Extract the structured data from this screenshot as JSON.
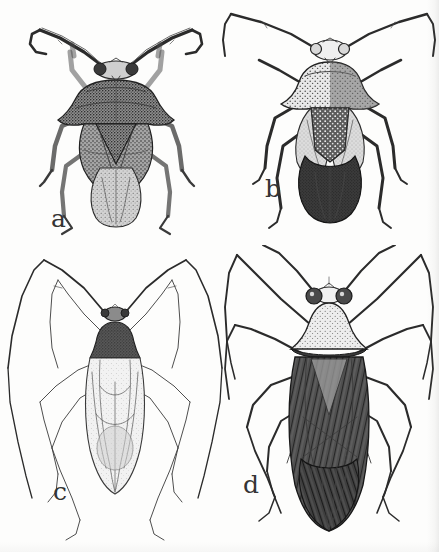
{
  "plate": {
    "type": "scanned-scientific-illustration-plate",
    "medium": "pen-and-ink stipple drawing",
    "background_color": "#fdfdfc",
    "ink_color": "#2b2b2b",
    "layout": "2x2 grid of four dorsal-view insect habitus drawings",
    "width_px": 439,
    "height_px": 552
  },
  "figures": [
    {
      "label": "a",
      "label_position": "lower-left of figure",
      "quadrant": "top-left",
      "subject": "true bug, dorsal view",
      "description": "Broad-bodied bug with mottled granular pronotum bearing lateral humeral angles, thick flattened antennae held in a wide inverted-V, dark speckled hemelytra and a paler rounded abdominal apex",
      "tone": "dark mottled",
      "antennae": "stout, segments flattened and expanded",
      "legs": "moderate length, banded"
    },
    {
      "label": "b",
      "label_position": "lower-left of figure",
      "quadrant": "top-right",
      "subject": "true bug, dorsal view",
      "description": "Bug with pale coarsely punctate pronotum, dark scutellum spotted with white punctures, pale corium and a broad dark membrane covering the abdominal apex",
      "tone": "pale pronotum, dark abdomen",
      "antennae": "long, slender, elbowed outward",
      "legs": "long, pale with dark annulations"
    },
    {
      "label": "c",
      "label_position": "lower-left of figure",
      "quadrant": "bottom-left",
      "subject": "slender true bug (mirid-like), dorsal view",
      "description": "Very slender elongate bug with narrow dark pronotum, translucent finely veined hemelytra, and extremely long hair-thin antennae and legs spread in wide inverted-V arcs",
      "tone": "light / translucent",
      "antennae": "extremely long and filiform",
      "legs": "very long and thin, widely splayed"
    },
    {
      "label": "d",
      "label_position": "lower-left of figure",
      "quadrant": "bottom-right",
      "subject": "true bug, dorsal view",
      "description": "Bug with pale triangular stippled pronotum, large bulging lateral eyes, and long dark hemelytra with strongly hatched longitudinal venation forming an X-shaped pattern",
      "tone": "pale head and pronotum, dark wings",
      "antennae": "long, slender, directed upward and outward",
      "legs": "long, slender, raised at the femur"
    }
  ],
  "labels": {
    "a": "a",
    "b": "b",
    "c": "c",
    "d": "d"
  }
}
